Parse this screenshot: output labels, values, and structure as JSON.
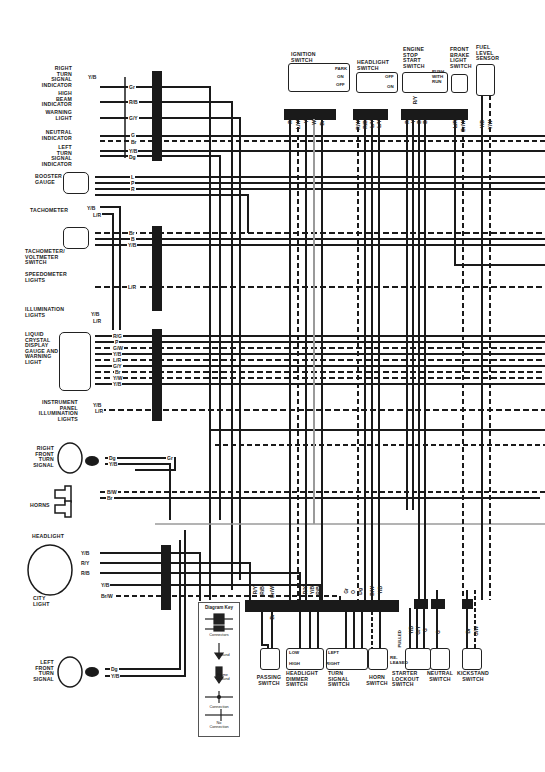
{
  "diagram": {
    "left_components": [
      {
        "id": "right-turn-signal-indicator",
        "label": "RIGHT\nTURN\nSIGNAL\nINDICATOR",
        "wires": [
          "Y/B",
          "Gr"
        ]
      },
      {
        "id": "high-beam-indicator",
        "label": "HIGH\nBEAM\nINDICATOR",
        "wires": [
          "R/B"
        ]
      },
      {
        "id": "warning-light",
        "label": "WARNING\nLIGHT",
        "wires": [
          "G/Y"
        ]
      },
      {
        "id": "neutral-indicator",
        "label": "NEUTRAL\nINDICATOR",
        "wires": [
          "G",
          "Br"
        ]
      },
      {
        "id": "left-turn-signal-indicator",
        "label": "LEFT\nTURN\nSIGNAL\nINDICATOR",
        "wires": [
          "Y/B",
          "Dg"
        ]
      },
      {
        "id": "booster-gauge",
        "label": "BOOSTER\nGAUGE",
        "wires": [
          "L",
          "P",
          "R"
        ]
      },
      {
        "id": "tachometer",
        "label": "TACHOMETER",
        "wires": [
          "Y/B",
          "L/R"
        ]
      },
      {
        "id": "tachometer-voltmeter-switch",
        "label": "TACHOMETER/\nVOLTMETER\nSWITCH",
        "wires": [
          "Br",
          "B",
          "Y/B"
        ]
      },
      {
        "id": "speedometer-lights",
        "label": "SPEEDOMETER\nLIGHTS",
        "wires": [
          "L/R"
        ]
      },
      {
        "id": "illumination-lights",
        "label": "ILLUMINATION\nLIGHTS",
        "wires": [
          "Y/B",
          "L/R"
        ]
      },
      {
        "id": "lcd-gauge",
        "label": "LIQUID\nCRYSTAL\nDISPLAY\nGAUGE AND\nWARNING\nLIGHT",
        "wires": [
          "R/G",
          "P",
          "G/W",
          "Y/B",
          "L/R",
          "G/Y",
          "Br",
          "Y/W",
          "Y/B"
        ]
      },
      {
        "id": "instrument-panel-illumination",
        "label": "INSTRUMENT\nPANEL\nILLUMINATION\nLIGHTS",
        "wires": [
          "Y/B",
          "L/R"
        ]
      },
      {
        "id": "right-front-turn-signal",
        "label": "RIGHT\nFRONT\nTURN\nSIGNAL",
        "wires": [
          "Dg",
          "Y/B",
          "Gr"
        ]
      },
      {
        "id": "horns",
        "label": "HORNS",
        "wires": [
          "B/W",
          "Br"
        ]
      },
      {
        "id": "headlight",
        "label": "HEADLIGHT",
        "wires": [
          "Y/B",
          "R/Y",
          "R/B"
        ]
      },
      {
        "id": "city-light",
        "label": "CITY\nLIGHT",
        "wires": [
          "Y/B",
          "Br/W"
        ]
      },
      {
        "id": "left-front-turn-signal",
        "label": "LEFT\nFRONT\nTURN\nSIGNAL",
        "wires": [
          "Dg",
          "Y/B"
        ]
      }
    ],
    "top_switches": [
      {
        "id": "ignition-switch",
        "label": "IGNITION\nSWITCH",
        "positions": [
          "PARK",
          "ON",
          "OFF"
        ],
        "wires": [
          "R",
          "L/W",
          "Y",
          "W",
          "Br"
        ]
      },
      {
        "id": "headlight-switch",
        "label": "HEADLIGHT\nSWITCH",
        "positions": [
          "OFF",
          "ON"
        ],
        "wires": [
          "R/W",
          "R/B",
          "L/Y",
          "L/Y"
        ]
      },
      {
        "id": "engine-stop-start-switch",
        "label": "ENGINE\nSTOP\nSTART\nSWITCH",
        "positions": [
          "PUSH\nWITH\nRUN"
        ],
        "wires": [
          "R",
          "Y",
          "B",
          "B"
        ],
        "extra_wire": "R/Y"
      },
      {
        "id": "front-brake-light-switch",
        "label": "FRONT\nBRAKE\nLIGHT\nSWITCH",
        "wires": [
          "L/R",
          "Br/W"
        ]
      },
      {
        "id": "fuel-level-sensor",
        "label": "FUEL\nLEVEL\nSENSOR",
        "wires": [
          "Y/B",
          "Y/W"
        ]
      }
    ],
    "bottom_switches": [
      {
        "id": "passing-switch",
        "label": "PASSING\nSWITCH",
        "wires": [
          "R/Y",
          "R/B",
          "Br/W",
          "Br"
        ]
      },
      {
        "id": "headlight-dimmer-switch",
        "label": "HEADLIGHT\nDIMMER\nSWITCH",
        "positions": [
          "LOW",
          "HIGH"
        ],
        "wires": [
          "R/Y",
          "Y/B",
          "R/B"
        ]
      },
      {
        "id": "turn-signal-switch",
        "label": "TURN\nSIGNAL\nSWITCH",
        "positions": [
          "LEFT",
          "RIGHT"
        ],
        "wires": [
          "Gr",
          "O",
          "Dg"
        ]
      },
      {
        "id": "horn-switch",
        "label": "HORN\nSWITCH",
        "wires": [
          "B/W",
          "Y/B"
        ]
      },
      {
        "id": "starter-lockout-switch",
        "label": "STARTER\nLOCKOUT\nSWITCH",
        "positions": [
          "PULLED",
          "RE-\nLEASED"
        ],
        "wires": [
          "Y/B",
          "G/Y",
          "G"
        ]
      },
      {
        "id": "neutral-switch",
        "label": "NEUTRAL\nSWITCH",
        "wires": [
          "G"
        ]
      },
      {
        "id": "kickstand-switch",
        "label": "KICKSTAND\nSWITCH",
        "wires": [
          "Br",
          "G/W"
        ]
      }
    ],
    "key": {
      "title": "Diagram Key",
      "items": [
        "Connectors",
        "Ground",
        "Frame\nGround",
        "Connection",
        "No\nConnection"
      ]
    },
    "colors": {
      "wire": "#1a1a1a",
      "gray_wire": "#9a9a9a",
      "background": "#ffffff"
    }
  }
}
